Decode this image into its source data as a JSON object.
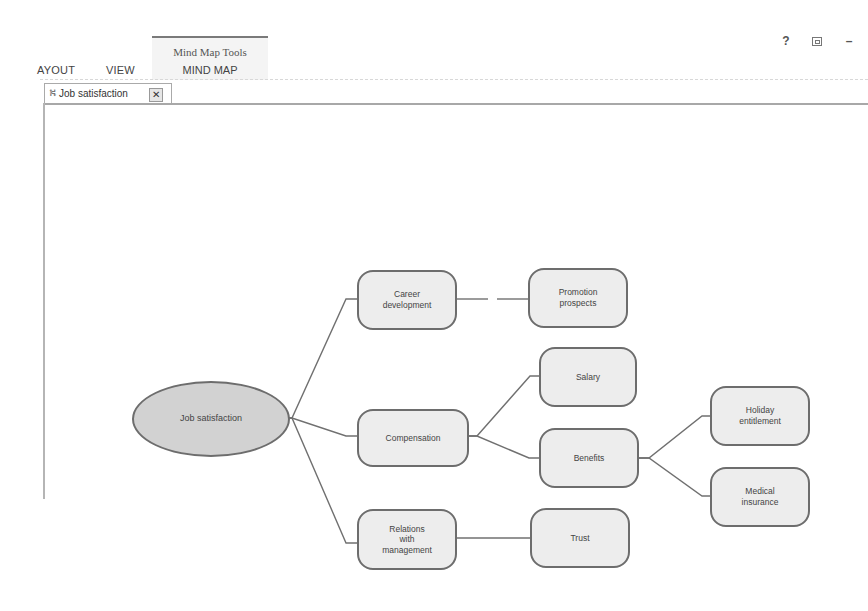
{
  "ribbon": {
    "tabs": [
      {
        "label": "AYOUT"
      },
      {
        "label": "VIEW"
      }
    ],
    "contextual_group": {
      "title": "Mind Map Tools",
      "tab": "MIND MAP"
    },
    "window_controls": {
      "help": "?",
      "restore": "restore-icon",
      "minimize": "–"
    }
  },
  "document_tab": {
    "icon": "mind-map-icon",
    "icon_glyph": "⛕",
    "label": "Job satisfaction",
    "close": "✕"
  },
  "mind_map": {
    "root": {
      "id": "job-satisfaction",
      "label": "Job satisfaction"
    },
    "nodes": [
      {
        "id": "career-development",
        "label": "Career\ndevelopment",
        "parent": "job-satisfaction"
      },
      {
        "id": "compensation",
        "label": "Compensation",
        "parent": "job-satisfaction"
      },
      {
        "id": "relations-with-management",
        "label": "Relations\nwith\nmanagement",
        "parent": "job-satisfaction"
      },
      {
        "id": "promotion-prospects",
        "label": "Promotion\nprospects",
        "parent": "career-development"
      },
      {
        "id": "salary",
        "label": "Salary",
        "parent": "compensation"
      },
      {
        "id": "benefits",
        "label": "Benefits",
        "parent": "compensation"
      },
      {
        "id": "trust",
        "label": "Trust",
        "parent": "relations-with-management"
      },
      {
        "id": "holiday-entitlement",
        "label": "Holiday\nentitlement",
        "parent": "benefits"
      },
      {
        "id": "medical-insurance",
        "label": "Medical\ninsurance",
        "parent": "benefits"
      }
    ]
  },
  "colors": {
    "node_fill": "#ededed",
    "root_fill": "#d2d2d2",
    "node_border": "#6d6d6d",
    "connector": "#707070"
  }
}
